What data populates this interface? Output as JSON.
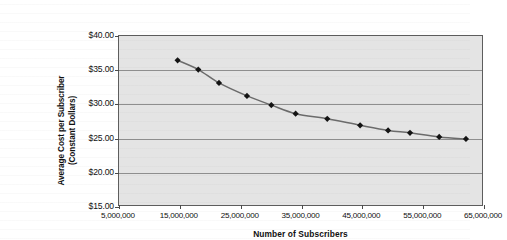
{
  "chart_data": {
    "type": "line",
    "title": "",
    "xlabel": "Number of Subscribers",
    "ylabel": "Average Cost per Subscriber (Constant Dollars)",
    "ylabel_line1": "Average Cost per Subscriber",
    "ylabel_line2": "(Constant Dollars)",
    "xlim": [
      5000000,
      65000000
    ],
    "ylim": [
      15.0,
      40.0
    ],
    "grid": true,
    "legend": false,
    "marker": "diamond",
    "x_tick_labels": [
      "5,000,000",
      "15,000,000",
      "25,000,000",
      "35,000,000",
      "45,000,000",
      "55,000,000",
      "65,000,000"
    ],
    "x_ticks": [
      5000000,
      15000000,
      25000000,
      35000000,
      45000000,
      55000000,
      65000000
    ],
    "y_tick_labels": [
      "$40.00",
      "$35.00",
      "$30.00",
      "$25.00",
      "$20.00",
      "$15.00"
    ],
    "y_ticks": [
      40.0,
      35.0,
      30.0,
      25.0,
      20.0,
      15.0
    ],
    "series": [
      {
        "name": "Average Cost per Subscriber",
        "x": [
          14800000,
          18200000,
          21600000,
          26200000,
          30200000,
          34200000,
          39400000,
          44800000,
          49400000,
          53000000,
          57800000,
          62200000
        ],
        "values": [
          36.3,
          34.95,
          33.0,
          31.1,
          29.75,
          28.5,
          27.75,
          26.8,
          26.05,
          25.7,
          25.1,
          24.8
        ]
      }
    ],
    "colors": {
      "plot_background": "#e4e4e4",
      "line": "#6b6b6b",
      "marker": "#131313",
      "gridline": "#8e8e8e",
      "frame": "#5d5d5d",
      "text": "#111111"
    }
  }
}
